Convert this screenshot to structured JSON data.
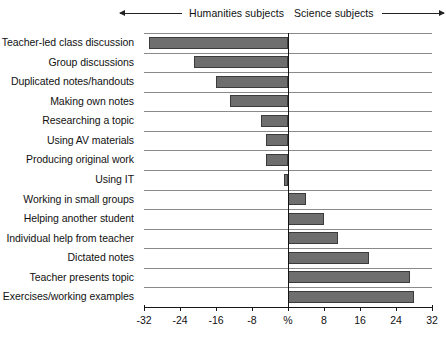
{
  "chart_data": {
    "type": "bar",
    "orientation": "horizontal",
    "title": "",
    "subtitle": "",
    "xlabel": "%",
    "ylabel": "",
    "xlim": [
      -32,
      32
    ],
    "xticks": [
      -32,
      -24,
      -16,
      -8,
      0,
      8,
      16,
      24,
      32
    ],
    "xtick_labels": [
      "-32",
      "-24",
      "-16",
      "-8",
      "%",
      "8",
      "16",
      "24",
      "32"
    ],
    "grid": true,
    "legend": false,
    "annotations": [
      {
        "text": "Humanities subjects",
        "side": "left",
        "arrow": "left"
      },
      {
        "text": "Science subjects",
        "side": "right",
        "arrow": "right"
      }
    ],
    "categories": [
      "Teacher-led class discussion",
      "Group discussions",
      "Duplicated notes/handouts",
      "Making own notes",
      "Researching a topic",
      "Using AV materials",
      "Producing original work",
      "Using IT",
      "Working in small groups",
      "Helping another student",
      "Individual help from teacher",
      "Dictated notes",
      "Teacher presents topic",
      "Exercises/working examples"
    ],
    "values": [
      -31,
      -21,
      -16,
      -13,
      -6,
      -5,
      -5,
      -1,
      4,
      8,
      11,
      18,
      27,
      28
    ]
  },
  "header": {
    "humanities_label": "Humanities subjects",
    "science_label": "Science subjects"
  },
  "colors": {
    "bar_fill": "#6e6e6e",
    "bar_stroke": "#3b3b3b",
    "axis": "#151515",
    "gridline": "#8a8a8a"
  }
}
